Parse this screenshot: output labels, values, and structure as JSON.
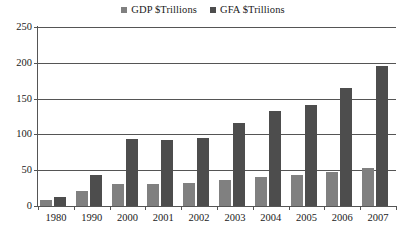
{
  "chart_data": {
    "type": "bar",
    "title": "",
    "subtitle": "",
    "xlabel": "",
    "ylabel": "",
    "ylim": [
      0,
      250
    ],
    "ytick_step": 50,
    "yticks": [
      "0",
      "50",
      "100",
      "150",
      "200",
      "250"
    ],
    "grid": "horizontal",
    "legend_position": "top-center",
    "categories": [
      "1980",
      "1990",
      "2000",
      "2001",
      "2002",
      "2003",
      "2004",
      "2005",
      "2006",
      "2007"
    ],
    "series": [
      {
        "name": "GDP $Trillions",
        "color": "#808080",
        "values": [
          9,
          21,
          31,
          31,
          32,
          36,
          41,
          44,
          48,
          53
        ]
      },
      {
        "name": "GFA $Trillions",
        "color": "#4d4d4d",
        "values": [
          12,
          43,
          94,
          92,
          95,
          116,
          133,
          141,
          165,
          195
        ]
      }
    ]
  },
  "axis": {
    "line_color": "#555555",
    "grid_color": "#555555"
  },
  "background_color": "#ffffff"
}
